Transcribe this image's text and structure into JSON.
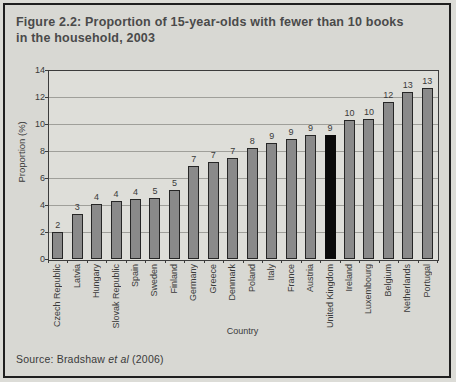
{
  "figure": {
    "title_line1": "Figure 2.2: Proportion of 15-year-olds with fewer than 10 books",
    "title_line2": "in the household, 2003",
    "source": {
      "prefix": "Source: Bradshaw ",
      "italic": "et al",
      "suffix": " (2006)"
    }
  },
  "colors": {
    "page_bg": "#dcdcd7",
    "figure_bg": "#d8d8d3",
    "frame_border": "#1f1f1f",
    "plot_bg": "#dedED9",
    "grid": "#9f9f9a",
    "axis": "#3c3c3c",
    "bar_fill": "#8a8a8a",
    "bar_edge": "#262626",
    "highlight_fill": "#0b0b0b",
    "text": "#3a3a3a",
    "title_text": "#4a4a4a"
  },
  "chart_data": {
    "type": "bar",
    "title": "Figure 2.2: Proportion of 15-year-olds with fewer than 10 books in the household, 2003",
    "xlabel": "Country",
    "ylabel": "Proportion (%)",
    "ylim": [
      0,
      14
    ],
    "yticks": [
      0,
      2,
      4,
      6,
      8,
      10,
      12,
      14
    ],
    "grid": true,
    "legend": "none",
    "highlight_category": "United Kingdom",
    "categories": [
      "Czech Republic",
      "Latvia",
      "Hungary",
      "Slovak Republic",
      "Spain",
      "Sweden",
      "Finland",
      "Germany",
      "Greece",
      "Denmark",
      "Poland",
      "Italy",
      "France",
      "Austria",
      "United Kingdom",
      "Ireland",
      "Luxembourg",
      "Belgium",
      "Netherlands",
      "Portugal"
    ],
    "values": [
      2,
      3,
      4,
      4,
      4,
      5,
      5,
      7,
      7,
      7,
      8,
      9,
      9,
      9,
      9,
      10,
      10,
      12,
      13,
      13
    ],
    "bar_heights": [
      2.0,
      3.3,
      4.05,
      4.3,
      4.45,
      4.55,
      5.1,
      6.9,
      7.2,
      7.45,
      8.2,
      8.6,
      8.9,
      9.2,
      9.2,
      10.3,
      10.35,
      11.6,
      12.4,
      12.7
    ]
  }
}
